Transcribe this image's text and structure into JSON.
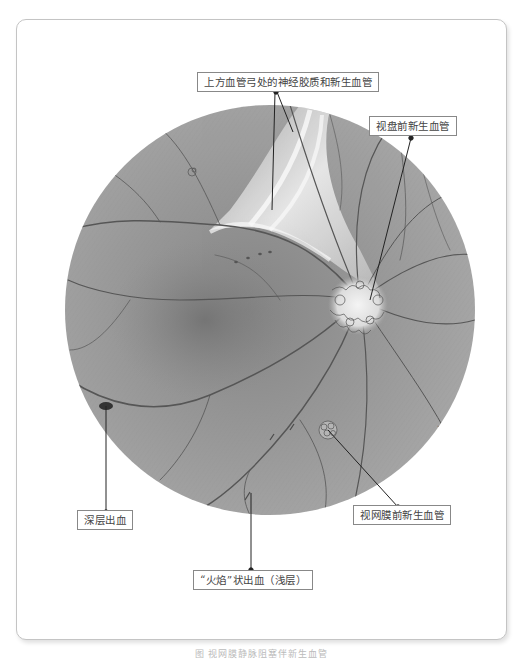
{
  "figure": {
    "caption": "图 视网膜静脉阻塞伴新生血管",
    "labels": {
      "top": "上方血管弓处的神经胶质和新生血管",
      "disc_nv": "视盘前新生血管",
      "deep_hemorrhage": "深层出血",
      "retinal_nv": "视网膜前新生血管",
      "flame_hemorrhage": "“火焰”状出血（浅层）"
    },
    "colors": {
      "fundus_base": "#9a9a9a",
      "fundus_dark": "#7a7a7a",
      "vessel": "#555555",
      "leader_line": "#222222",
      "label_border": "#888888",
      "frame_border": "#c4c4c4"
    },
    "signature": "Maasalu"
  }
}
